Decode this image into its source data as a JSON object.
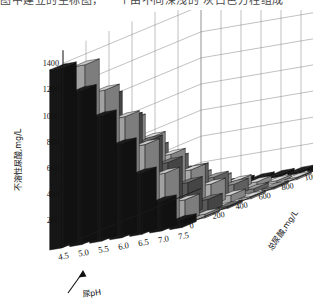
{
  "caption": {
    "clipped_text": "图中建立的坐标图， 一个由不同深浅的 灰白色方柱组成"
  },
  "chart_data": {
    "type": "bar",
    "projection": "3d",
    "title": "",
    "xlabel": "尿pH",
    "ylabel": "不溶性尿酸,mg/L",
    "zlabel": "总尿酸,mg/L",
    "x_categories": [
      "4.5",
      "5.0",
      "5.5",
      "6.0",
      "6.5",
      "7.0",
      "7.5"
    ],
    "z_categories": [
      "1200",
      "1000",
      "800",
      "600",
      "400",
      "200",
      "0"
    ],
    "y_ticks": [
      "200",
      "400",
      "600",
      "800",
      "1000",
      "1200",
      "1400"
    ],
    "ylim": [
      0,
      1500
    ],
    "grid": true,
    "legend": "none",
    "annotation_arrow": "尿pH axis pointer",
    "series": [
      {
        "name": "1200",
        "color": "#1c1c1c",
        "values": [
          1380,
          1180,
          960,
          720,
          470,
          230,
          60
        ]
      },
      {
        "name": "1000",
        "color": "#c9c9c9",
        "values": [
          1330,
          1110,
          880,
          640,
          395,
          165,
          30
        ]
      },
      {
        "name": "800",
        "color": "#6f6f6f",
        "values": [
          1010,
          820,
          620,
          430,
          250,
          95,
          15
        ]
      },
      {
        "name": "600",
        "color": "#d5d5d5",
        "values": [
          760,
          600,
          445,
          300,
          165,
          55,
          10
        ]
      },
      {
        "name": "400",
        "color": "#9a9a9a",
        "values": [
          470,
          360,
          260,
          170,
          90,
          30,
          5
        ]
      },
      {
        "name": "200",
        "color": "#dcdcdc",
        "values": [
          215,
          160,
          110,
          70,
          35,
          10,
          2
        ]
      },
      {
        "name": "0",
        "color": "#1f1f1f",
        "values": [
          0,
          0,
          0,
          0,
          0,
          0,
          0
        ]
      }
    ]
  },
  "colors": {
    "background": "#ffffff",
    "grid": "#8d8d8d",
    "axis": "#1a1a1a",
    "text": "#111111"
  }
}
